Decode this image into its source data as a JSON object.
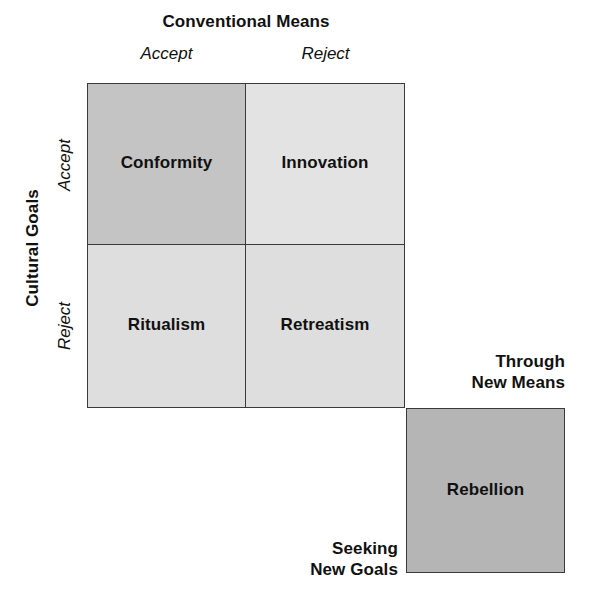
{
  "diagram": {
    "type": "2x2-typology-matrix",
    "top_axis": {
      "title": "Conventional Means",
      "columns": [
        {
          "label": "Accept"
        },
        {
          "label": "Reject"
        }
      ]
    },
    "left_axis": {
      "title": "Cultural Goals",
      "rows": [
        {
          "label": "Accept"
        },
        {
          "label": "Reject"
        }
      ]
    },
    "cells": [
      {
        "name": "Conformity",
        "row": "Accept",
        "column": "Accept",
        "fill": "#c4c4c4"
      },
      {
        "name": "Innovation",
        "row": "Accept",
        "column": "Reject",
        "fill": "#e3e3e3"
      },
      {
        "name": "Ritualism",
        "row": "Reject",
        "column": "Accept",
        "fill": "#dedede"
      },
      {
        "name": "Retreatism",
        "row": "Reject",
        "column": "Reject",
        "fill": "#dedede"
      }
    ],
    "rebellion": {
      "name": "Rebellion",
      "fill": "#b5b5b5",
      "means_label_line1": "Through",
      "means_label_line2": "New Means",
      "goals_label_line1": "Seeking",
      "goals_label_line2": "New Goals"
    }
  }
}
